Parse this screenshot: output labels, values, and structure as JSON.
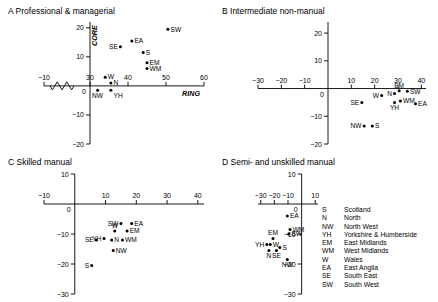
{
  "figure": {
    "axis_names": {
      "y": "CORE",
      "x": "RING"
    }
  },
  "legend": {
    "title": "",
    "entries": [
      {
        "abbr": "S",
        "name": "Scotland"
      },
      {
        "abbr": "N",
        "name": "North"
      },
      {
        "abbr": "NW",
        "name": "North West"
      },
      {
        "abbr": "YH",
        "name": "Yorkshire & Humberside"
      },
      {
        "abbr": "EM",
        "name": "East Midlands"
      },
      {
        "abbr": "WM",
        "name": "West Midlands"
      },
      {
        "abbr": "W",
        "name": "Wales"
      },
      {
        "abbr": "EA",
        "name": "East Anglia"
      },
      {
        "abbr": "SE",
        "name": "South East"
      },
      {
        "abbr": "SW",
        "name": "South West"
      }
    ]
  },
  "chart_data": [
    {
      "panel": "A",
      "type": "scatter",
      "title": "Professional & managerial",
      "xlabel": "RING",
      "ylabel": "CORE",
      "xlim": [
        -10,
        60
      ],
      "ylim": [
        -20,
        22
      ],
      "xticks": [
        -10,
        30,
        40,
        50,
        60
      ],
      "yticks": [
        -20,
        -10,
        0,
        10,
        20
      ],
      "axis_break": true,
      "grid": false,
      "points": [
        {
          "label": "SW",
          "x": 50.5,
          "y": 19.5,
          "lp": "right"
        },
        {
          "label": "EA",
          "x": 41.0,
          "y": 15.5,
          "lp": "right"
        },
        {
          "label": "SE",
          "x": 38.0,
          "y": 13.5,
          "lp": "left"
        },
        {
          "label": "S",
          "x": 44.0,
          "y": 11.5,
          "lp": "right"
        },
        {
          "label": "EM",
          "x": 45.0,
          "y": 8.0,
          "lp": "right"
        },
        {
          "label": "WM",
          "x": 45.0,
          "y": 6.0,
          "lp": "right"
        },
        {
          "label": "W",
          "x": 34.0,
          "y": 3.0,
          "lp": "right"
        },
        {
          "label": "N",
          "x": 35.5,
          "y": 1.0,
          "lp": "right"
        },
        {
          "label": "NW",
          "x": 32.0,
          "y": -1.5,
          "lp": "below"
        },
        {
          "label": "YH",
          "x": 35.5,
          "y": -1.5,
          "lp": "belowright"
        }
      ]
    },
    {
      "panel": "B",
      "type": "scatter",
      "title": "Intermediate  non-manual",
      "xlabel": "",
      "ylabel": "",
      "xlim": [
        -30,
        42
      ],
      "ylim": [
        -20,
        24
      ],
      "xticks": [
        -30,
        -20,
        -10,
        10,
        20,
        30,
        40
      ],
      "yticks": [
        -20,
        -10,
        0,
        10,
        20
      ],
      "axis_break": false,
      "grid": false,
      "points": [
        {
          "label": "SW",
          "x": 34.0,
          "y": -1.0,
          "lp": "right"
        },
        {
          "label": "EM",
          "x": 30.5,
          "y": -0.8,
          "lp": "above"
        },
        {
          "label": "N",
          "x": 28.5,
          "y": -1.8,
          "lp": "left"
        },
        {
          "label": "W",
          "x": 23.0,
          "y": -2.5,
          "lp": "left"
        },
        {
          "label": "WM",
          "x": 31.0,
          "y": -4.5,
          "lp": "right"
        },
        {
          "label": "YH",
          "x": 28.5,
          "y": -5.0,
          "lp": "below"
        },
        {
          "label": "EA",
          "x": 37.5,
          "y": -5.5,
          "lp": "right"
        },
        {
          "label": "SE",
          "x": 14.5,
          "y": -5.0,
          "lp": "left"
        },
        {
          "label": "S",
          "x": 19.0,
          "y": -13.5,
          "lp": "right"
        },
        {
          "label": "NW",
          "x": 15.5,
          "y": -13.5,
          "lp": "left"
        }
      ]
    },
    {
      "panel": "C",
      "type": "scatter",
      "title": "Skilled manual",
      "xlabel": "",
      "ylabel": "",
      "xlim": [
        -10,
        42
      ],
      "ylim": [
        -30,
        10
      ],
      "xticks": [
        -10,
        10,
        20,
        30,
        40
      ],
      "yticks": [
        -30,
        -20,
        -10,
        0,
        10
      ],
      "axis_break": false,
      "grid": false,
      "points": [
        {
          "label": "SW",
          "x": 15.0,
          "y": -6.5,
          "lp": "left"
        },
        {
          "label": "EA",
          "x": 18.5,
          "y": -6.5,
          "lp": "right"
        },
        {
          "label": "W",
          "x": 13.0,
          "y": -9.0,
          "lp": "above"
        },
        {
          "label": "EM",
          "x": 17.0,
          "y": -9.0,
          "lp": "right"
        },
        {
          "label": "YH",
          "x": 9.5,
          "y": -11.5,
          "lp": "left"
        },
        {
          "label": "N",
          "x": 12.0,
          "y": -12.0,
          "lp": "right"
        },
        {
          "label": "WM",
          "x": 15.5,
          "y": -12.0,
          "lp": "right"
        },
        {
          "label": "SE",
          "x": 7.0,
          "y": -12.0,
          "lp": "left"
        },
        {
          "label": "NW",
          "x": 12.5,
          "y": -15.5,
          "lp": "right"
        },
        {
          "label": "S",
          "x": 5.5,
          "y": -20.5,
          "lp": "left"
        }
      ]
    },
    {
      "panel": "D",
      "type": "scatter",
      "title": "Semi- and unskilled manual",
      "xlabel": "",
      "ylabel": "",
      "xlim": [
        -32,
        12
      ],
      "ylim": [
        -30,
        10
      ],
      "xticks": [
        -30,
        -20,
        -10,
        10
      ],
      "yticks": [
        -30,
        -20,
        -10,
        0,
        10
      ],
      "axis_break": false,
      "grid": false,
      "points": [
        {
          "label": "EA",
          "x": -10.5,
          "y": -4.0,
          "lp": "right"
        },
        {
          "label": "WM",
          "x": -8.5,
          "y": -8.5,
          "lp": "right"
        },
        {
          "label": "SW",
          "x": -9.5,
          "y": -10.0,
          "lp": "right"
        },
        {
          "label": "EM",
          "x": -21.0,
          "y": -11.5,
          "lp": "above"
        },
        {
          "label": "YH",
          "x": -25.5,
          "y": -13.5,
          "lp": "left"
        },
        {
          "label": "W",
          "x": -23.0,
          "y": -13.5,
          "lp": "right"
        },
        {
          "label": "N",
          "x": -24.0,
          "y": -15.5,
          "lp": "below"
        },
        {
          "label": "SE",
          "x": -18.5,
          "y": -15.5,
          "lp": "below"
        },
        {
          "label": "S",
          "x": -16.0,
          "y": -14.5,
          "lp": "right"
        },
        {
          "label": "NW",
          "x": -10.5,
          "y": -18.5,
          "lp": "below"
        }
      ]
    }
  ]
}
